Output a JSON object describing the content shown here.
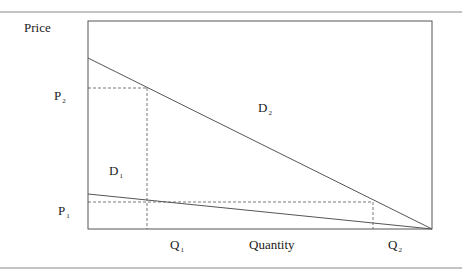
{
  "axes": {
    "y_label": "Price",
    "x_label": "Quantity"
  },
  "curves": [
    {
      "name": "D",
      "sub": "1"
    },
    {
      "name": "D",
      "sub": "2"
    }
  ],
  "price_ticks": [
    {
      "name": "P",
      "sub": "2"
    },
    {
      "name": "P",
      "sub": "1"
    }
  ],
  "quantity_ticks": [
    {
      "name": "Q",
      "sub": "1"
    },
    {
      "name": "Q",
      "sub": "2"
    }
  ],
  "colors": {
    "line": "#555555",
    "rule": "#888888",
    "text": "#222222"
  }
}
